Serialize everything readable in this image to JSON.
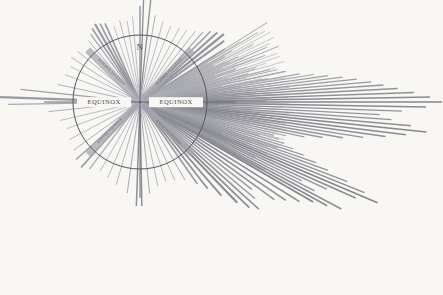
{
  "figure": {
    "type": "solar-ray-compass-diagram",
    "background_color": "#f8f7f4",
    "title": "",
    "circle": {
      "cx": 140,
      "cy": 102,
      "r": 67,
      "stroke": "#555560",
      "stroke_width": 1
    }
  },
  "labels": {
    "north": "N",
    "equinox_west": "EQUINOX",
    "equinox_east": "EQUINOX",
    "solstice_ne": "SUMMER SOLSTICE",
    "solstice_nw": "SUMMER SOLSTICE",
    "solstice_se": "WINTER SOLSTICE",
    "solstice_sw": "WINTER SOLSTICE"
  },
  "colors": {
    "ray_light": "#b9b9bf",
    "ray_mid": "#9a9aa2",
    "ray_dark": "#7d7d86",
    "axis": "#6a6a74",
    "band": "#a8a8b0",
    "circle": "#555560",
    "text": "#4a4a52"
  },
  "chart_data": {
    "type": "scatter",
    "title": "",
    "xlabel": "",
    "ylabel": "",
    "center": [
      140,
      102
    ],
    "radius": 67,
    "axis_rays": [
      {
        "angle_deg": 0,
        "length": 96,
        "width": 1.0,
        "color": "#6a6a74"
      },
      {
        "angle_deg": 90,
        "length": 96,
        "width": 1.0,
        "color": "#6a6a74"
      },
      {
        "angle_deg": 180,
        "length": 96,
        "width": 1.0,
        "color": "#6a6a74"
      },
      {
        "angle_deg": 270,
        "length": 96,
        "width": 1.0,
        "color": "#6a6a74"
      }
    ],
    "solstice_bands": [
      {
        "angle_deg": 45,
        "length": 74,
        "width": 7,
        "color": "#a8a8b0"
      },
      {
        "angle_deg": 135,
        "length": 74,
        "width": 7,
        "color": "#a8a8b0"
      },
      {
        "angle_deg": 225,
        "length": 74,
        "width": 7,
        "color": "#a8a8b0"
      },
      {
        "angle_deg": 315,
        "length": 74,
        "width": 7,
        "color": "#a8a8b0"
      }
    ],
    "rays": [
      {
        "angle_deg": 88,
        "length": 103,
        "width": 1.3,
        "color": "#8d8d96"
      },
      {
        "angle_deg": 84,
        "length": 104,
        "width": 1.3,
        "color": "#8d8d96"
      },
      {
        "angle_deg": 95,
        "length": 86,
        "width": 0.8,
        "color": "#b0b0b8"
      },
      {
        "angle_deg": 99,
        "length": 82,
        "width": 0.8,
        "color": "#b0b0b8"
      },
      {
        "angle_deg": 104,
        "length": 84,
        "width": 0.8,
        "color": "#acacb5"
      },
      {
        "angle_deg": 109,
        "length": 80,
        "width": 0.8,
        "color": "#b4b4bc"
      },
      {
        "angle_deg": 114,
        "length": 86,
        "width": 1.6,
        "color": "#9a9aa2"
      },
      {
        "angle_deg": 117,
        "length": 88,
        "width": 1.6,
        "color": "#9a9aa2"
      },
      {
        "angle_deg": 120,
        "length": 90,
        "width": 2.0,
        "color": "#95959e"
      },
      {
        "angle_deg": 123,
        "length": 88,
        "width": 1.6,
        "color": "#9a9aa2"
      },
      {
        "angle_deg": 126,
        "length": 84,
        "width": 1.2,
        "color": "#a4a4ac"
      },
      {
        "angle_deg": 130,
        "length": 80,
        "width": 1.0,
        "color": "#aeaeb6"
      },
      {
        "angle_deg": 141,
        "length": 80,
        "width": 1.0,
        "color": "#b2b2ba"
      },
      {
        "angle_deg": 147,
        "length": 82,
        "width": 1.0,
        "color": "#b2b2ba"
      },
      {
        "angle_deg": 153,
        "length": 78,
        "width": 0.9,
        "color": "#b6b6be"
      },
      {
        "angle_deg": 160,
        "length": 80,
        "width": 0.9,
        "color": "#b6b6be"
      },
      {
        "angle_deg": 168,
        "length": 84,
        "width": 1.0,
        "color": "#b0b0b8"
      },
      {
        "angle_deg": 174,
        "length": 120,
        "width": 1.2,
        "color": "#a0a0a8"
      },
      {
        "angle_deg": 178,
        "length": 142,
        "width": 2.4,
        "color": "#9a9aa2"
      },
      {
        "angle_deg": 181,
        "length": 132,
        "width": 1.2,
        "color": "#a8a8b0"
      },
      {
        "angle_deg": 186,
        "length": 92,
        "width": 1.0,
        "color": "#b0b0b8"
      },
      {
        "angle_deg": 193,
        "length": 82,
        "width": 0.9,
        "color": "#b6b6be"
      },
      {
        "angle_deg": 200,
        "length": 78,
        "width": 0.9,
        "color": "#b6b6be"
      },
      {
        "angle_deg": 208,
        "length": 80,
        "width": 0.9,
        "color": "#b4b4bc"
      },
      {
        "angle_deg": 216,
        "length": 82,
        "width": 1.0,
        "color": "#b0b0b8"
      },
      {
        "angle_deg": 222,
        "length": 86,
        "width": 1.4,
        "color": "#a2a2aa"
      },
      {
        "angle_deg": 228,
        "length": 88,
        "width": 1.6,
        "color": "#9c9ca4"
      },
      {
        "angle_deg": 233,
        "length": 84,
        "width": 1.2,
        "color": "#a8a8b0"
      },
      {
        "angle_deg": 240,
        "length": 80,
        "width": 0.9,
        "color": "#b4b4bc"
      },
      {
        "angle_deg": 247,
        "length": 82,
        "width": 0.9,
        "color": "#b2b2ba"
      },
      {
        "angle_deg": 254,
        "length": 86,
        "width": 0.9,
        "color": "#aeaeb6"
      },
      {
        "angle_deg": 262,
        "length": 92,
        "width": 1.0,
        "color": "#a8a8b0"
      },
      {
        "angle_deg": 268,
        "length": 104,
        "width": 1.5,
        "color": "#8e8e97"
      },
      {
        "angle_deg": 271,
        "length": 104,
        "width": 1.5,
        "color": "#8e8e97"
      },
      {
        "angle_deg": 276,
        "length": 92,
        "width": 1.0,
        "color": "#aaaab2"
      },
      {
        "angle_deg": 282,
        "length": 86,
        "width": 0.9,
        "color": "#b0b0b8"
      },
      {
        "angle_deg": 288,
        "length": 84,
        "width": 0.9,
        "color": "#b2b2ba"
      },
      {
        "angle_deg": 294,
        "length": 86,
        "width": 0.9,
        "color": "#aeaeb6"
      },
      {
        "angle_deg": 300,
        "length": 90,
        "width": 1.0,
        "color": "#a8a8b0"
      },
      {
        "angle_deg": 305,
        "length": 100,
        "width": 1.6,
        "color": "#9a9aa2"
      },
      {
        "angle_deg": 308,
        "length": 110,
        "width": 1.8,
        "color": "#92929b"
      },
      {
        "angle_deg": 311,
        "length": 124,
        "width": 1.8,
        "color": "#8e8e97"
      },
      {
        "angle_deg": 314,
        "length": 140,
        "width": 2.0,
        "color": "#8a8a93"
      },
      {
        "angle_deg": 316,
        "length": 152,
        "width": 1.8,
        "color": "#8e8e97"
      },
      {
        "angle_deg": 318,
        "length": 160,
        "width": 1.6,
        "color": "#92929b"
      },
      {
        "angle_deg": 320,
        "length": 150,
        "width": 1.4,
        "color": "#98989f"
      },
      {
        "angle_deg": 322,
        "length": 142,
        "width": 1.4,
        "color": "#98989f"
      },
      {
        "angle_deg": 324,
        "length": 166,
        "width": 1.6,
        "color": "#92929b"
      },
      {
        "angle_deg": 326,
        "length": 176,
        "width": 1.6,
        "color": "#8e8e97"
      },
      {
        "angle_deg": 328,
        "length": 188,
        "width": 1.6,
        "color": "#8a8a93"
      },
      {
        "angle_deg": 330,
        "length": 200,
        "width": 1.8,
        "color": "#86868f"
      },
      {
        "angle_deg": 331,
        "length": 214,
        "width": 1.6,
        "color": "#8a8a93"
      },
      {
        "angle_deg": 332,
        "length": 228,
        "width": 1.6,
        "color": "#8e8e97"
      },
      {
        "angle_deg": 333,
        "length": 196,
        "width": 1.4,
        "color": "#95959e"
      },
      {
        "angle_deg": 334,
        "length": 180,
        "width": 1.4,
        "color": "#98989f"
      },
      {
        "angle_deg": 335,
        "length": 206,
        "width": 1.5,
        "color": "#92929b"
      },
      {
        "angle_deg": 336,
        "length": 236,
        "width": 1.6,
        "color": "#8a8a93"
      },
      {
        "angle_deg": 337,
        "length": 258,
        "width": 1.6,
        "color": "#86868f"
      },
      {
        "angle_deg": 338,
        "length": 242,
        "width": 1.4,
        "color": "#8e8e97"
      },
      {
        "angle_deg": 339,
        "length": 222,
        "width": 1.4,
        "color": "#92929b"
      },
      {
        "angle_deg": 340,
        "length": 200,
        "width": 1.4,
        "color": "#95959e"
      },
      {
        "angle_deg": 341,
        "length": 186,
        "width": 1.3,
        "color": "#98989f"
      },
      {
        "angle_deg": 342,
        "length": 172,
        "width": 1.3,
        "color": "#9a9aa2"
      },
      {
        "angle_deg": 343,
        "length": 160,
        "width": 1.2,
        "color": "#9e9ea6"
      },
      {
        "angle_deg": 344,
        "length": 150,
        "width": 1.2,
        "color": "#a0a0a8"
      },
      {
        "angle_deg": 345,
        "length": 144,
        "width": 1.2,
        "color": "#a2a2aa"
      },
      {
        "angle_deg": 346,
        "length": 138,
        "width": 1.1,
        "color": "#a4a4ac"
      },
      {
        "angle_deg": 347,
        "length": 150,
        "width": 1.2,
        "color": "#a0a0a8"
      },
      {
        "angle_deg": 348,
        "length": 168,
        "width": 1.3,
        "color": "#9c9ca4"
      },
      {
        "angle_deg": 349,
        "length": 186,
        "width": 1.3,
        "color": "#98989f"
      },
      {
        "angle_deg": 350,
        "length": 206,
        "width": 1.4,
        "color": "#95959e"
      },
      {
        "angle_deg": 351,
        "length": 226,
        "width": 1.4,
        "color": "#92929b"
      },
      {
        "angle_deg": 352,
        "length": 248,
        "width": 1.5,
        "color": "#8e8e97"
      },
      {
        "angle_deg": 353,
        "length": 268,
        "width": 1.5,
        "color": "#8a8a93"
      },
      {
        "angle_deg": 354,
        "length": 288,
        "width": 1.5,
        "color": "#86868f"
      },
      {
        "angle_deg": 355,
        "length": 272,
        "width": 1.4,
        "color": "#8e8e97"
      },
      {
        "angle_deg": 356,
        "length": 252,
        "width": 1.4,
        "color": "#92929b"
      },
      {
        "angle_deg": 357,
        "length": 240,
        "width": 1.3,
        "color": "#95959e"
      },
      {
        "angle_deg": 358,
        "length": 262,
        "width": 1.4,
        "color": "#92929b"
      },
      {
        "angle_deg": 359,
        "length": 286,
        "width": 1.5,
        "color": "#8a8a93"
      },
      {
        "angle_deg": 360,
        "length": 302,
        "width": 1.6,
        "color": "#86868f"
      },
      {
        "angle_deg": 361,
        "length": 290,
        "width": 1.5,
        "color": "#8a8a93"
      },
      {
        "angle_deg": 362,
        "length": 274,
        "width": 1.4,
        "color": "#8e8e97"
      },
      {
        "angle_deg": 363,
        "length": 258,
        "width": 1.4,
        "color": "#92929b"
      },
      {
        "angle_deg": 364,
        "length": 244,
        "width": 1.3,
        "color": "#95959e"
      },
      {
        "angle_deg": 365,
        "length": 232,
        "width": 1.3,
        "color": "#98989f"
      },
      {
        "angle_deg": 366,
        "length": 218,
        "width": 1.3,
        "color": "#9a9aa2"
      },
      {
        "angle_deg": 367,
        "length": 204,
        "width": 1.2,
        "color": "#9e9ea6"
      },
      {
        "angle_deg": 368,
        "length": 190,
        "width": 1.2,
        "color": "#a0a0a8"
      },
      {
        "angle_deg": 369,
        "length": 176,
        "width": 1.2,
        "color": "#a2a2aa"
      },
      {
        "angle_deg": 370,
        "length": 162,
        "width": 1.1,
        "color": "#a4a4ac"
      },
      {
        "angle_deg": 372,
        "length": 148,
        "width": 1.1,
        "color": "#a8a8b0"
      },
      {
        "angle_deg": 374,
        "length": 134,
        "width": 1.0,
        "color": "#aaaab2"
      },
      {
        "angle_deg": 376,
        "length": 120,
        "width": 1.0,
        "color": "#aeaeb6"
      },
      {
        "angle_deg": 378,
        "length": 112,
        "width": 1.0,
        "color": "#b0b0b8"
      },
      {
        "angle_deg": 381,
        "length": 104,
        "width": 1.0,
        "color": "#b2b2ba"
      },
      {
        "angle_deg": 384,
        "length": 98,
        "width": 1.0,
        "color": "#b4b4bc"
      },
      {
        "angle_deg": 388,
        "length": 96,
        "width": 1.2,
        "color": "#aeaeb6"
      },
      {
        "angle_deg": 392,
        "length": 100,
        "width": 1.6,
        "color": "#a0a0a8"
      },
      {
        "angle_deg": 396,
        "length": 104,
        "width": 2.0,
        "color": "#98989f"
      },
      {
        "angle_deg": 399,
        "length": 108,
        "width": 2.2,
        "color": "#92929b"
      },
      {
        "angle_deg": 402,
        "length": 104,
        "width": 2.0,
        "color": "#98989f"
      },
      {
        "angle_deg": 405,
        "length": 100,
        "width": 1.6,
        "color": "#a0a0a8"
      },
      {
        "angle_deg": 408,
        "length": 94,
        "width": 1.2,
        "color": "#a8a8b0"
      },
      {
        "angle_deg": 412,
        "length": 90,
        "width": 1.0,
        "color": "#aeaeb6"
      },
      {
        "angle_deg": 417,
        "length": 86,
        "width": 0.9,
        "color": "#b2b2ba"
      },
      {
        "angle_deg": 422,
        "length": 84,
        "width": 0.9,
        "color": "#b4b4bc"
      },
      {
        "angle_deg": 428,
        "length": 82,
        "width": 0.9,
        "color": "#b6b6be"
      },
      {
        "angle_deg": 434,
        "length": 84,
        "width": 0.9,
        "color": "#b4b4bc"
      },
      {
        "angle_deg": 440,
        "length": 88,
        "width": 1.0,
        "color": "#b0b0b8"
      }
    ],
    "dense_fan": {
      "start_deg": 330,
      "end_deg": 392,
      "count": 130,
      "min_length": 78,
      "max_length": 150,
      "color": "#9e9ea6",
      "note": "Tight inner fan of short rays just beyond the circle on the east/south-east quadrant"
    }
  }
}
